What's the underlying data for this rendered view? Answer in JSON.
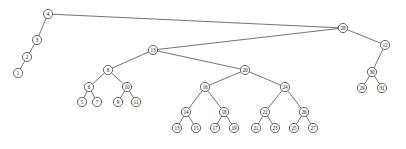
{
  "figure": {
    "type": "tree-graph",
    "background_color": "#ffffff",
    "node_fill_color": "#ffffff",
    "node_stroke_color": "#2b2b2b",
    "edge_color": "#3a3a3a",
    "label_color": "#111111",
    "node_radius": 4.6
  },
  "chart_data": {
    "type": "diagram",
    "subtype": "binary-search-tree",
    "node_count": 31,
    "nodes": [
      {
        "id": "n1",
        "label": "1",
        "x": 18,
        "y": 73
      },
      {
        "id": "n2",
        "label": "2",
        "x": 27,
        "y": 57
      },
      {
        "id": "n3",
        "label": "3",
        "x": 37,
        "y": 40
      },
      {
        "id": "n4",
        "label": "4",
        "x": 48,
        "y": 14
      },
      {
        "id": "n5",
        "label": "5",
        "x": 82,
        "y": 102
      },
      {
        "id": "n6",
        "label": "6",
        "x": 89,
        "y": 87
      },
      {
        "id": "n7",
        "label": "7",
        "x": 97,
        "y": 102
      },
      {
        "id": "n8",
        "label": "8",
        "x": 108,
        "y": 70
      },
      {
        "id": "n9",
        "label": "9",
        "x": 118,
        "y": 102
      },
      {
        "id": "n10",
        "label": "10",
        "x": 127,
        "y": 87
      },
      {
        "id": "n11",
        "label": "11",
        "x": 136,
        "y": 102
      },
      {
        "id": "n12",
        "label": "12",
        "x": 385,
        "y": 45
      },
      {
        "id": "n13",
        "label": "13",
        "x": 177,
        "y": 128
      },
      {
        "id": "n14",
        "label": "14",
        "x": 186,
        "y": 112
      },
      {
        "id": "n15",
        "label": "15",
        "x": 196,
        "y": 128
      },
      {
        "id": "n16",
        "label": "16",
        "x": 205,
        "y": 87
      },
      {
        "id": "n17",
        "label": "17",
        "x": 215,
        "y": 128
      },
      {
        "id": "n18",
        "label": "18",
        "x": 224,
        "y": 112
      },
      {
        "id": "n19",
        "label": "19",
        "x": 234,
        "y": 128
      },
      {
        "id": "n20",
        "label": "20",
        "x": 245,
        "y": 70
      },
      {
        "id": "n21",
        "label": "21",
        "x": 256,
        "y": 128
      },
      {
        "id": "n22",
        "label": "22",
        "x": 265,
        "y": 112
      },
      {
        "id": "n23",
        "label": "23",
        "x": 275,
        "y": 128
      },
      {
        "id": "n24",
        "label": "24",
        "x": 285,
        "y": 87
      },
      {
        "id": "n25",
        "label": "25",
        "x": 294,
        "y": 128
      },
      {
        "id": "n26",
        "label": "26",
        "x": 304,
        "y": 112
      },
      {
        "id": "n27",
        "label": "27",
        "x": 313,
        "y": 128
      },
      {
        "id": "n28",
        "label": "28",
        "x": 343,
        "y": 28
      },
      {
        "id": "n29",
        "label": "29",
        "x": 362,
        "y": 88
      },
      {
        "id": "n30",
        "label": "30",
        "x": 372,
        "y": 72
      },
      {
        "id": "n31",
        "label": "31",
        "x": 382,
        "y": 88
      },
      {
        "id": "n13r",
        "label": "13",
        "x": 153,
        "y": 50
      }
    ],
    "edges": [
      {
        "from": "n4",
        "to": "n3"
      },
      {
        "from": "n3",
        "to": "n2"
      },
      {
        "from": "n2",
        "to": "n1"
      },
      {
        "from": "n4",
        "to": "n28"
      },
      {
        "from": "n28",
        "to": "n13r"
      },
      {
        "from": "n28",
        "to": "n12"
      },
      {
        "from": "n12",
        "to": "n30"
      },
      {
        "from": "n30",
        "to": "n29"
      },
      {
        "from": "n30",
        "to": "n31"
      },
      {
        "from": "n13r",
        "to": "n8"
      },
      {
        "from": "n13r",
        "to": "n20"
      },
      {
        "from": "n8",
        "to": "n6"
      },
      {
        "from": "n8",
        "to": "n10"
      },
      {
        "from": "n6",
        "to": "n5"
      },
      {
        "from": "n6",
        "to": "n7"
      },
      {
        "from": "n10",
        "to": "n9"
      },
      {
        "from": "n10",
        "to": "n11"
      },
      {
        "from": "n20",
        "to": "n16"
      },
      {
        "from": "n20",
        "to": "n24"
      },
      {
        "from": "n16",
        "to": "n14"
      },
      {
        "from": "n16",
        "to": "n18"
      },
      {
        "from": "n14",
        "to": "n13"
      },
      {
        "from": "n14",
        "to": "n15"
      },
      {
        "from": "n18",
        "to": "n17"
      },
      {
        "from": "n18",
        "to": "n19"
      },
      {
        "from": "n24",
        "to": "n22"
      },
      {
        "from": "n24",
        "to": "n26"
      },
      {
        "from": "n22",
        "to": "n21"
      },
      {
        "from": "n22",
        "to": "n23"
      },
      {
        "from": "n26",
        "to": "n25"
      },
      {
        "from": "n26",
        "to": "n27"
      }
    ]
  }
}
